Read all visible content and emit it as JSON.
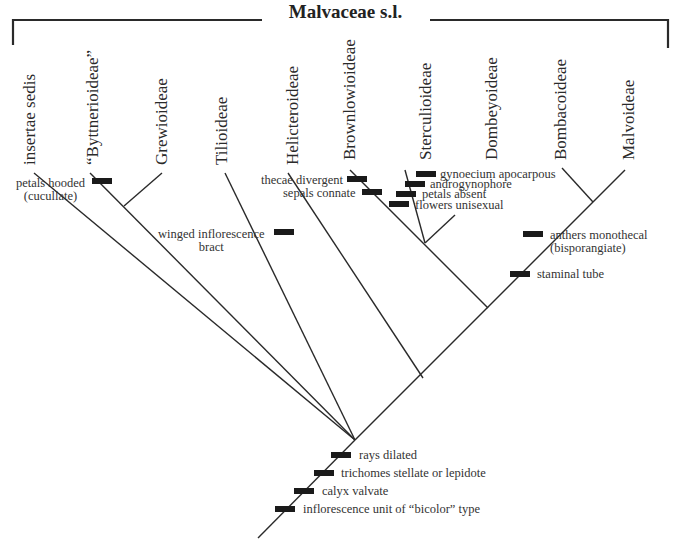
{
  "title": "Malvaceae s.l.",
  "taxa": [
    {
      "name": "insertae sedis"
    },
    {
      "name": "“Byttnerioideae”"
    },
    {
      "name": "Grewioideae"
    },
    {
      "name": "Tilioideae"
    },
    {
      "name": "Helicteroideae"
    },
    {
      "name": "Brownlowioideae"
    },
    {
      "name": "Sterculioideae"
    },
    {
      "name": "Dombeyoideae"
    },
    {
      "name": "Bombacoideae"
    },
    {
      "name": "Malvoideae"
    }
  ],
  "characters": {
    "petals_hooded": {
      "line1": "petals hooded",
      "line2": "(cucullate)"
    },
    "winged_inflorescence": {
      "line1": "winged inflorescence",
      "line2": "bract"
    },
    "thecae_divergent": "thecae divergent",
    "sepals_connate": "sepals connate",
    "gynoecium_apocarpous": "gynoecium apocarpous",
    "androgynophore": "androgynophore",
    "petals_absent": "petals absent",
    "flowers_unisexual": "flowers unisexual",
    "anthers_monothecal": {
      "line1": "anthers monothecal",
      "line2": "(bisporangiate)"
    },
    "staminal_tube": "staminal tube",
    "rays_dilated": "rays dilated",
    "trichomes": "trichomes stellate or lepidote",
    "calyx_valvate": "calyx valvate",
    "inflorescence_unit": "inflorescence unit of “bicolor” type"
  }
}
